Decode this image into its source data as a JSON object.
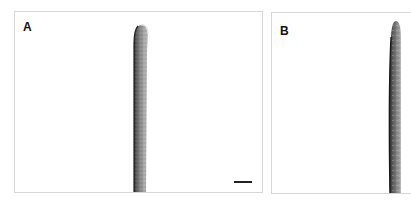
{
  "figure": {
    "panels": [
      {
        "id": "A",
        "label": "A",
        "content": "micrograph of a single elongated hair/trichome-like structure with rounded tip",
        "has_scale_bar": true
      },
      {
        "id": "B",
        "label": "B",
        "content": "micrograph of a single elongated hair/trichome-like structure, partially cropped at right edge",
        "has_scale_bar": false
      }
    ],
    "colors": {
      "background": "#ffffff",
      "border": "#d6d6d6",
      "hair_dark": "#3a3a3a",
      "hair_mid": "#8a8a8a",
      "hair_light": "#c8c8c8",
      "scale_bar": "#222222"
    }
  }
}
